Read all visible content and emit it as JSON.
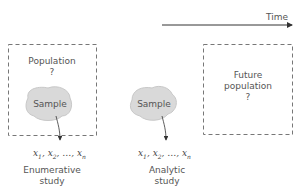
{
  "diagram": {
    "time_label": "Time",
    "left": {
      "box_label": "Population",
      "box_mark": "?",
      "sample_label": "Sample",
      "observations": [
        "x1",
        "x2",
        "...",
        "xn"
      ],
      "caption_line1": "Enumerative",
      "caption_line2": "study"
    },
    "middle": {
      "sample_label": "Sample",
      "observations": [
        "x1",
        "x2",
        "...",
        "xn"
      ],
      "caption_line1": "Analytic",
      "caption_line2": "study"
    },
    "right": {
      "box_label_line1": "Future",
      "box_label_line2": "population",
      "box_mark": "?"
    },
    "colors": {
      "line": "#555555",
      "blob": "#d9d9d9",
      "dash": "#777777"
    }
  }
}
